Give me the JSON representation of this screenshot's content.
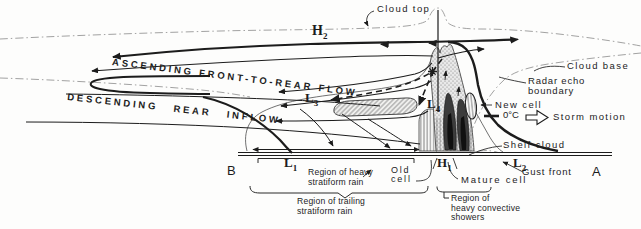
{
  "figure": {
    "type": "squall-line cross-section schematic",
    "flow_labels": {
      "ascending": "ASCENDING FRONT-TO-REAR FLOW",
      "descending": "DESCENDING REAR INFLOW"
    },
    "annotations": {
      "cloud_top": "Cloud top",
      "cloud_base": "Cloud base",
      "radar_echo_line1": "Radar echo",
      "radar_echo_line2": "boundary",
      "new_cell": "New cell",
      "zero_deg": "0°C",
      "storm_motion": "Storm motion",
      "shelf_cloud": "Shelf cloud",
      "gust_front": "Gust front",
      "mature_cell": "Mature cell",
      "old_cell_line1": "Old",
      "old_cell_line2": "cell"
    },
    "regions": {
      "heavy_stratiform_line1": "Region of heavy",
      "heavy_stratiform_line2": "stratiform rain",
      "trailing_stratiform_line1": "Region of trailing",
      "trailing_stratiform_line2": "stratiform rain",
      "convective_line1": "Region of",
      "convective_line2": "heavy convective",
      "convective_line3": "showers"
    },
    "pressure_labels": {
      "h2": {
        "base": "H",
        "sub": "2"
      },
      "l3": {
        "base": "L",
        "sub": "3"
      },
      "l4": {
        "base": "L",
        "sub": "4"
      },
      "l1": {
        "base": "L",
        "sub": "1"
      },
      "h1": {
        "base": "H",
        "sub": "1"
      },
      "l2": {
        "base": "L",
        "sub": "2"
      }
    },
    "endpoints": {
      "left": "B",
      "right": "A"
    },
    "icons": {
      "storm_motion_arrow": "open right-arrow",
      "particle_marker": "asterisk on hydrometeor trajectory"
    },
    "colors": {
      "ink": "#1c1c1c",
      "core_dark": "#3c3c3c",
      "stipple_bg": "#e9e9e9"
    }
  }
}
